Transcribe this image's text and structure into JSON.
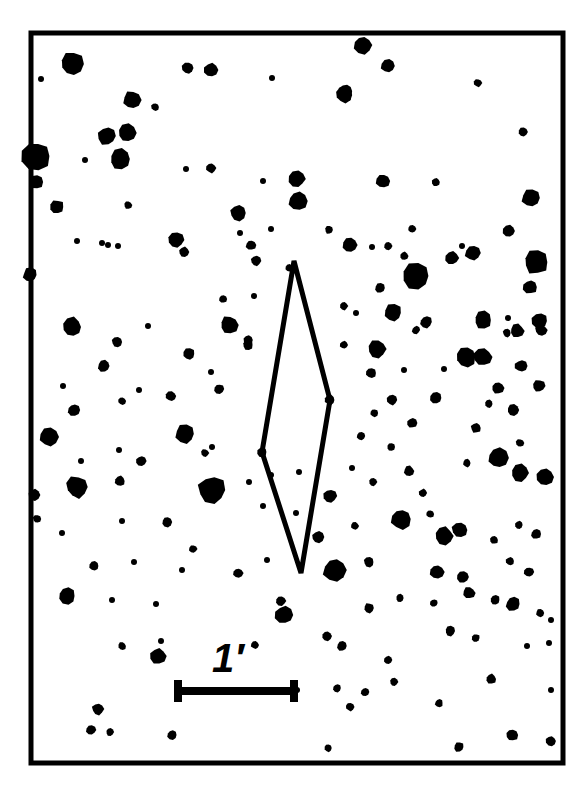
{
  "figure": {
    "type": "micrograph",
    "background_color": "#ffffff",
    "ink_color": "#000000"
  },
  "frame": {
    "name": "image-border",
    "x": 31,
    "y": 33,
    "width": 532,
    "height": 730,
    "stroke_width": 5,
    "color": "#000000"
  },
  "unit_cell": {
    "name": "rhombus-outline",
    "label": "unit cell marker",
    "stroke_width": 5,
    "color": "#000000",
    "vertices": [
      [
        294,
        261
      ],
      [
        330,
        400
      ],
      [
        301,
        573
      ],
      [
        262,
        452
      ]
    ]
  },
  "scale_bar": {
    "label": "1′",
    "label_x": 228,
    "label_y": 672,
    "label_font_size": 40,
    "bar_x1": 174,
    "bar_x2": 298,
    "bar_y": 691,
    "bar_thickness": 8,
    "cap_height": 22,
    "color": "#000000"
  },
  "caption": {
    "text": ""
  },
  "chart_data": {
    "type": "scatter",
    "title": "",
    "xlabel": "",
    "ylabel": "",
    "xlim": [
      31,
      563
    ],
    "ylim": [
      33,
      763
    ],
    "grid": false,
    "legend": null,
    "marker": "filled-circle",
    "color": "#000000",
    "note": "Each point is a dark particle; r is the apparent radius in pixels.",
    "points": [
      {
        "x": 41,
        "y": 79,
        "r": 3
      },
      {
        "x": 72,
        "y": 64,
        "r": 12
      },
      {
        "x": 132,
        "y": 100,
        "r": 9
      },
      {
        "x": 188,
        "y": 68,
        "r": 6
      },
      {
        "x": 211,
        "y": 70,
        "r": 7
      },
      {
        "x": 272,
        "y": 78,
        "r": 3
      },
      {
        "x": 346,
        "y": 91,
        "r": 7
      },
      {
        "x": 363,
        "y": 45,
        "r": 9
      },
      {
        "x": 388,
        "y": 66,
        "r": 7
      },
      {
        "x": 478,
        "y": 83,
        "r": 4
      },
      {
        "x": 523,
        "y": 132,
        "r": 5
      },
      {
        "x": 127,
        "y": 133,
        "r": 9
      },
      {
        "x": 155,
        "y": 107,
        "r": 4
      },
      {
        "x": 344,
        "y": 95,
        "r": 8
      },
      {
        "x": 348,
        "y": 98,
        "r": 3
      },
      {
        "x": 36,
        "y": 156,
        "r": 14
      },
      {
        "x": 36,
        "y": 182,
        "r": 7
      },
      {
        "x": 107,
        "y": 136,
        "r": 9
      },
      {
        "x": 120,
        "y": 159,
        "r": 10
      },
      {
        "x": 85,
        "y": 160,
        "r": 3
      },
      {
        "x": 186,
        "y": 169,
        "r": 3
      },
      {
        "x": 211,
        "y": 168,
        "r": 5
      },
      {
        "x": 263,
        "y": 181,
        "r": 3
      },
      {
        "x": 297,
        "y": 179,
        "r": 8
      },
      {
        "x": 383,
        "y": 181,
        "r": 7
      },
      {
        "x": 436,
        "y": 182,
        "r": 4
      },
      {
        "x": 531,
        "y": 198,
        "r": 9
      },
      {
        "x": 57,
        "y": 207,
        "r": 7
      },
      {
        "x": 128,
        "y": 205,
        "r": 4
      },
      {
        "x": 238,
        "y": 213,
        "r": 8
      },
      {
        "x": 240,
        "y": 233,
        "r": 3
      },
      {
        "x": 271,
        "y": 229,
        "r": 3
      },
      {
        "x": 298,
        "y": 201,
        "r": 9
      },
      {
        "x": 329,
        "y": 230,
        "r": 4
      },
      {
        "x": 412,
        "y": 229,
        "r": 4
      },
      {
        "x": 462,
        "y": 246,
        "r": 3
      },
      {
        "x": 509,
        "y": 231,
        "r": 6
      },
      {
        "x": 77,
        "y": 241,
        "r": 3
      },
      {
        "x": 102,
        "y": 243,
        "r": 3
      },
      {
        "x": 108,
        "y": 245,
        "r": 3
      },
      {
        "x": 118,
        "y": 246,
        "r": 3
      },
      {
        "x": 176,
        "y": 240,
        "r": 8
      },
      {
        "x": 184,
        "y": 252,
        "r": 5
      },
      {
        "x": 251,
        "y": 245,
        "r": 5
      },
      {
        "x": 256,
        "y": 261,
        "r": 5
      },
      {
        "x": 289,
        "y": 268,
        "r": 4
      },
      {
        "x": 350,
        "y": 245,
        "r": 7
      },
      {
        "x": 372,
        "y": 247,
        "r": 3
      },
      {
        "x": 388,
        "y": 246,
        "r": 4
      },
      {
        "x": 404,
        "y": 256,
        "r": 4
      },
      {
        "x": 452,
        "y": 258,
        "r": 7
      },
      {
        "x": 473,
        "y": 253,
        "r": 8
      },
      {
        "x": 536,
        "y": 262,
        "r": 12
      },
      {
        "x": 416,
        "y": 276,
        "r": 14
      },
      {
        "x": 30,
        "y": 275,
        "r": 7
      },
      {
        "x": 254,
        "y": 296,
        "r": 3
      },
      {
        "x": 223,
        "y": 299,
        "r": 4
      },
      {
        "x": 380,
        "y": 288,
        "r": 5
      },
      {
        "x": 508,
        "y": 318,
        "r": 3
      },
      {
        "x": 530,
        "y": 287,
        "r": 7
      },
      {
        "x": 72,
        "y": 327,
        "r": 10
      },
      {
        "x": 148,
        "y": 326,
        "r": 3
      },
      {
        "x": 229,
        "y": 325,
        "r": 9
      },
      {
        "x": 248,
        "y": 340,
        "r": 5
      },
      {
        "x": 344,
        "y": 306,
        "r": 4
      },
      {
        "x": 393,
        "y": 313,
        "r": 9
      },
      {
        "x": 426,
        "y": 322,
        "r": 6
      },
      {
        "x": 483,
        "y": 320,
        "r": 9
      },
      {
        "x": 517,
        "y": 331,
        "r": 7
      },
      {
        "x": 540,
        "y": 321,
        "r": 8
      },
      {
        "x": 104,
        "y": 366,
        "r": 6
      },
      {
        "x": 117,
        "y": 342,
        "r": 5
      },
      {
        "x": 189,
        "y": 354,
        "r": 6
      },
      {
        "x": 356,
        "y": 313,
        "r": 3
      },
      {
        "x": 377,
        "y": 349,
        "r": 9
      },
      {
        "x": 416,
        "y": 330,
        "r": 4
      },
      {
        "x": 466,
        "y": 357,
        "r": 10
      },
      {
        "x": 507,
        "y": 333,
        "r": 4
      },
      {
        "x": 541,
        "y": 330,
        "r": 6
      },
      {
        "x": 63,
        "y": 386,
        "r": 3
      },
      {
        "x": 139,
        "y": 390,
        "r": 3
      },
      {
        "x": 211,
        "y": 372,
        "r": 3
      },
      {
        "x": 248,
        "y": 345,
        "r": 5
      },
      {
        "x": 344,
        "y": 345,
        "r": 4
      },
      {
        "x": 404,
        "y": 370,
        "r": 3
      },
      {
        "x": 483,
        "y": 357,
        "r": 9
      },
      {
        "x": 521,
        "y": 366,
        "r": 6
      },
      {
        "x": 74,
        "y": 410,
        "r": 6
      },
      {
        "x": 122,
        "y": 401,
        "r": 4
      },
      {
        "x": 171,
        "y": 396,
        "r": 5
      },
      {
        "x": 219,
        "y": 389,
        "r": 5
      },
      {
        "x": 371,
        "y": 373,
        "r": 5
      },
      {
        "x": 444,
        "y": 369,
        "r": 3
      },
      {
        "x": 498,
        "y": 388,
        "r": 6
      },
      {
        "x": 539,
        "y": 386,
        "r": 6
      },
      {
        "x": 49,
        "y": 437,
        "r": 9
      },
      {
        "x": 119,
        "y": 450,
        "r": 3
      },
      {
        "x": 185,
        "y": 434,
        "r": 10
      },
      {
        "x": 212,
        "y": 447,
        "r": 3
      },
      {
        "x": 330,
        "y": 400,
        "r": 5
      },
      {
        "x": 374,
        "y": 413,
        "r": 4
      },
      {
        "x": 392,
        "y": 400,
        "r": 5
      },
      {
        "x": 436,
        "y": 398,
        "r": 6
      },
      {
        "x": 489,
        "y": 404,
        "r": 4
      },
      {
        "x": 513,
        "y": 410,
        "r": 6
      },
      {
        "x": 81,
        "y": 461,
        "r": 3
      },
      {
        "x": 141,
        "y": 461,
        "r": 5
      },
      {
        "x": 205,
        "y": 453,
        "r": 4
      },
      {
        "x": 262,
        "y": 452,
        "r": 5
      },
      {
        "x": 361,
        "y": 436,
        "r": 4
      },
      {
        "x": 391,
        "y": 447,
        "r": 4
      },
      {
        "x": 412,
        "y": 423,
        "r": 5
      },
      {
        "x": 476,
        "y": 428,
        "r": 5
      },
      {
        "x": 520,
        "y": 443,
        "r": 4
      },
      {
        "x": 77,
        "y": 487,
        "r": 11
      },
      {
        "x": 120,
        "y": 481,
        "r": 5
      },
      {
        "x": 212,
        "y": 490,
        "r": 14
      },
      {
        "x": 249,
        "y": 482,
        "r": 3
      },
      {
        "x": 271,
        "y": 475,
        "r": 3
      },
      {
        "x": 299,
        "y": 472,
        "r": 3
      },
      {
        "x": 352,
        "y": 468,
        "r": 3
      },
      {
        "x": 373,
        "y": 482,
        "r": 4
      },
      {
        "x": 409,
        "y": 471,
        "r": 5
      },
      {
        "x": 423,
        "y": 493,
        "r": 4
      },
      {
        "x": 467,
        "y": 463,
        "r": 4
      },
      {
        "x": 498,
        "y": 458,
        "r": 10
      },
      {
        "x": 520,
        "y": 473,
        "r": 9
      },
      {
        "x": 545,
        "y": 477,
        "r": 9
      },
      {
        "x": 122,
        "y": 521,
        "r": 3
      },
      {
        "x": 167,
        "y": 522,
        "r": 5
      },
      {
        "x": 193,
        "y": 549,
        "r": 4
      },
      {
        "x": 263,
        "y": 506,
        "r": 3
      },
      {
        "x": 296,
        "y": 513,
        "r": 3
      },
      {
        "x": 330,
        "y": 496,
        "r": 7
      },
      {
        "x": 355,
        "y": 526,
        "r": 4
      },
      {
        "x": 401,
        "y": 519,
        "r": 10
      },
      {
        "x": 430,
        "y": 514,
        "r": 4
      },
      {
        "x": 444,
        "y": 536,
        "r": 9
      },
      {
        "x": 460,
        "y": 530,
        "r": 8
      },
      {
        "x": 494,
        "y": 540,
        "r": 4
      },
      {
        "x": 519,
        "y": 525,
        "r": 4
      },
      {
        "x": 536,
        "y": 534,
        "r": 5
      },
      {
        "x": 62,
        "y": 533,
        "r": 3
      },
      {
        "x": 94,
        "y": 566,
        "r": 5
      },
      {
        "x": 134,
        "y": 562,
        "r": 3
      },
      {
        "x": 182,
        "y": 570,
        "r": 3
      },
      {
        "x": 238,
        "y": 573,
        "r": 5
      },
      {
        "x": 267,
        "y": 560,
        "r": 3
      },
      {
        "x": 318,
        "y": 537,
        "r": 6
      },
      {
        "x": 335,
        "y": 570,
        "r": 12
      },
      {
        "x": 369,
        "y": 562,
        "r": 5
      },
      {
        "x": 437,
        "y": 572,
        "r": 7
      },
      {
        "x": 463,
        "y": 577,
        "r": 6
      },
      {
        "x": 510,
        "y": 561,
        "r": 4
      },
      {
        "x": 529,
        "y": 572,
        "r": 5
      },
      {
        "x": 67,
        "y": 596,
        "r": 8
      },
      {
        "x": 112,
        "y": 600,
        "r": 3
      },
      {
        "x": 156,
        "y": 604,
        "r": 3
      },
      {
        "x": 281,
        "y": 601,
        "r": 5
      },
      {
        "x": 284,
        "y": 615,
        "r": 9
      },
      {
        "x": 369,
        "y": 608,
        "r": 5
      },
      {
        "x": 400,
        "y": 598,
        "r": 4
      },
      {
        "x": 434,
        "y": 603,
        "r": 4
      },
      {
        "x": 469,
        "y": 593,
        "r": 6
      },
      {
        "x": 495,
        "y": 600,
        "r": 5
      },
      {
        "x": 513,
        "y": 604,
        "r": 7
      },
      {
        "x": 540,
        "y": 613,
        "r": 4
      },
      {
        "x": 551,
        "y": 620,
        "r": 3
      },
      {
        "x": 161,
        "y": 641,
        "r": 3
      },
      {
        "x": 122,
        "y": 646,
        "r": 4
      },
      {
        "x": 158,
        "y": 656,
        "r": 8
      },
      {
        "x": 255,
        "y": 645,
        "r": 4
      },
      {
        "x": 327,
        "y": 636,
        "r": 5
      },
      {
        "x": 342,
        "y": 646,
        "r": 5
      },
      {
        "x": 388,
        "y": 660,
        "r": 4
      },
      {
        "x": 476,
        "y": 638,
        "r": 4
      },
      {
        "x": 450,
        "y": 631,
        "r": 5
      },
      {
        "x": 527,
        "y": 646,
        "r": 3
      },
      {
        "x": 549,
        "y": 643,
        "r": 3
      },
      {
        "x": 394,
        "y": 682,
        "r": 4
      },
      {
        "x": 491,
        "y": 679,
        "r": 5
      },
      {
        "x": 365,
        "y": 692,
        "r": 4
      },
      {
        "x": 297,
        "y": 690,
        "r": 3
      },
      {
        "x": 98,
        "y": 709,
        "r": 6
      },
      {
        "x": 337,
        "y": 688,
        "r": 4
      },
      {
        "x": 350,
        "y": 707,
        "r": 4
      },
      {
        "x": 439,
        "y": 703,
        "r": 4
      },
      {
        "x": 551,
        "y": 690,
        "r": 3
      },
      {
        "x": 91,
        "y": 730,
        "r": 5
      },
      {
        "x": 110,
        "y": 732,
        "r": 4
      },
      {
        "x": 172,
        "y": 735,
        "r": 5
      },
      {
        "x": 328,
        "y": 748,
        "r": 4
      },
      {
        "x": 459,
        "y": 747,
        "r": 5
      },
      {
        "x": 512,
        "y": 735,
        "r": 6
      },
      {
        "x": 551,
        "y": 741,
        "r": 5
      },
      {
        "x": 34,
        "y": 495,
        "r": 6
      },
      {
        "x": 37,
        "y": 519,
        "r": 4
      }
    ]
  }
}
